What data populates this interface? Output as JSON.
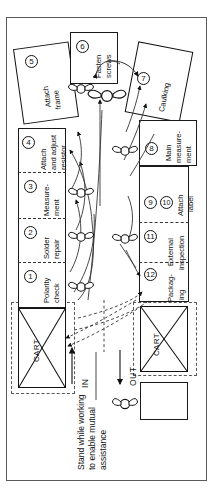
{
  "diagram": {
    "type": "assembly-line-cell-layout",
    "orientation": "rotated-90-ccw",
    "annotation": {
      "line1": "Stand while working",
      "line2": "to enable mutual",
      "line3": "assistance"
    },
    "flow": {
      "in_label": "IN",
      "out_label": "OUT"
    },
    "cart_label": "CART",
    "stations": [
      {
        "number": "1",
        "line1": "Polarity",
        "line2": "check",
        "line3": ""
      },
      {
        "number": "2",
        "line1": "Solder",
        "line2": "repair",
        "line3": ""
      },
      {
        "number": "3",
        "line1": "Measure-",
        "line2": "ment",
        "line3": ""
      },
      {
        "number": "4",
        "line1": "Attach",
        "line2": "and adjust",
        "line3": "resistor"
      },
      {
        "number": "5",
        "line1": "Attach",
        "line2": "frame",
        "line3": ""
      },
      {
        "number": "6",
        "line1": "Fasten",
        "line2": "screws",
        "line3": ""
      },
      {
        "number": "7",
        "line1": "Caulking",
        "line2": "",
        "line3": ""
      },
      {
        "number": "8",
        "line1": "Main",
        "line2": "measure-",
        "line3": "ment"
      },
      {
        "number": "9",
        "line1": "",
        "line2": "",
        "line3": ""
      },
      {
        "number": "10",
        "line1": "Attach",
        "line2": "label",
        "line3": ""
      },
      {
        "number": "11",
        "line1": "External",
        "line2": "inspection",
        "line3": ""
      },
      {
        "number": "12",
        "line1": "Packag-",
        "line2": "ing",
        "line3": ""
      }
    ],
    "colors": {
      "ink": "#111111",
      "frame": "#5a5a5a",
      "dashed": "#555555",
      "paper": "#ffffff"
    }
  }
}
